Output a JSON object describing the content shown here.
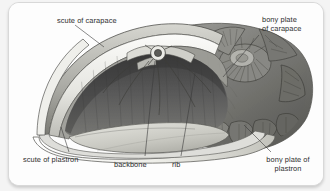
{
  "figure": {
    "style": "pencil-shaded scientific illustration",
    "colors": {
      "card_background": "#fdfdfd",
      "page_background": "#f4f4f4",
      "card_border": "#d8d8d8",
      "label_text": "#2f2f2f",
      "leader_line": "#3a3a3a",
      "shell_dark": "#4a4a4a",
      "shell_mid": "#8c8c8c",
      "shell_light": "#e8e8e6",
      "cavity_dark": "#5b5b5b",
      "plastron_floor": "#cfcfc9"
    }
  },
  "labels": {
    "scute_of_carapace": "scute of carapace",
    "bony_plate_of_carapace": "bony plate\nof carapace",
    "scute_of_plastron": "scute of plastron",
    "backbone": "backbone",
    "rib": "rib",
    "bony_plate_of_plastron": "bony plate of\nplastron"
  },
  "leader_lines": [
    {
      "name": "scute-of-carapace-leader",
      "from": [
        66,
        22
      ],
      "to": [
        95,
        44
      ]
    },
    {
      "name": "bony-plate-carapace-leader",
      "from": [
        252,
        31
      ],
      "to": [
        214,
        74
      ]
    },
    {
      "name": "scute-of-plastron-leader",
      "from": [
        60,
        150
      ],
      "to": [
        52,
        124
      ]
    },
    {
      "name": "backbone-leader",
      "from": [
        136,
        154
      ],
      "to": [
        145,
        57
      ]
    },
    {
      "name": "rib-leader",
      "from": [
        172,
        154
      ],
      "to": [
        186,
        70
      ]
    },
    {
      "name": "bony-plate-plastron-leader",
      "from": [
        262,
        150
      ],
      "to": [
        235,
        122
      ]
    }
  ]
}
